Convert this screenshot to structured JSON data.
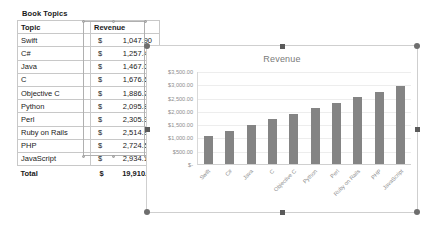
{
  "sheet": {
    "title": "Book Topics",
    "headers": [
      "Topic",
      "Revenue"
    ],
    "currency_symbol": "$",
    "rows": [
      {
        "topic": "Swift",
        "amount": "1,047.90"
      },
      {
        "topic": "C#",
        "amount": "1,257.48"
      },
      {
        "topic": "Java",
        "amount": "1,467.06"
      },
      {
        "topic": "C",
        "amount": "1,676.64"
      },
      {
        "topic": "Objective C",
        "amount": "1,886.22"
      },
      {
        "topic": "Python",
        "amount": "2,095.80"
      },
      {
        "topic": "Perl",
        "amount": "2,305.38"
      },
      {
        "topic": "Ruby on Rails",
        "amount": "2,514.96"
      },
      {
        "topic": "PHP",
        "amount": "2,724.54"
      },
      {
        "topic": "JavaScript",
        "amount": "2,934.12"
      }
    ],
    "total": {
      "label": "Total",
      "symbol": "$",
      "amount": "19,910.10"
    }
  },
  "chart_data": {
    "type": "bar",
    "title": "Revenue",
    "xlabel": "",
    "ylabel": "",
    "categories": [
      "Swift",
      "C#",
      "Java",
      "C",
      "Objective C",
      "Python",
      "Perl",
      "Ruby on Rails",
      "PHP",
      "JavaScript"
    ],
    "values": [
      1047.9,
      1257.48,
      1467.06,
      1676.64,
      1886.22,
      2095.8,
      2305.38,
      2514.96,
      2724.54,
      2934.12
    ],
    "ylim": [
      0,
      3500
    ],
    "ytick_labels": [
      "$3,500.00",
      "$3,000.00",
      "$2,500.00",
      "$2,000.00",
      "$1,500.00",
      "$1,000.00",
      "$500.00",
      "$-"
    ],
    "ytick_values": [
      3500,
      3000,
      2500,
      2000,
      1500,
      1000,
      500,
      0
    ],
    "grid": true,
    "legend": false,
    "series_color": "#848484"
  },
  "selection": {
    "chart_selected": true,
    "column_selected": "Revenue"
  }
}
